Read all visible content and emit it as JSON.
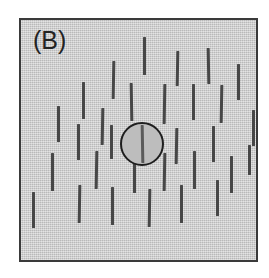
{
  "figure": {
    "panel_label": "(B)",
    "panel_width": 239,
    "panel_height": 244,
    "panel_left": 19,
    "panel_top": 18,
    "background_color": "#c9c9c9",
    "border_color": "#3a3a3a",
    "line_color": "#474747",
    "label_color": "#232323",
    "canvas_color": "#ffffff"
  },
  "target": {
    "name": "central-disc",
    "center_x": 121,
    "center_y": 124,
    "radius": 22,
    "fill_color": "#bdbdbd",
    "outline_color": "#1e1e1e",
    "inner_line_length": 38,
    "inner_line_tilt_deg": -1,
    "inner_line_color": "#5a5a5a"
  },
  "chart_data": {
    "type": "scatter",
    "title": "(B)",
    "xlabel": "",
    "ylabel": "",
    "xlim": [
      0,
      239
    ],
    "ylim": [
      0,
      244
    ],
    "grid": false,
    "legend": null,
    "element_count": 30,
    "elements": [
      {
        "x": 123,
        "y": 36,
        "length": 38,
        "angle": 0,
        "width": 3
      },
      {
        "x": 156,
        "y": 48,
        "length": 35,
        "angle": 1,
        "width": 3
      },
      {
        "x": 187,
        "y": 46,
        "length": 36,
        "angle": -1,
        "width": 3
      },
      {
        "x": 92,
        "y": 60,
        "length": 38,
        "angle": 1,
        "width": 3
      },
      {
        "x": 217,
        "y": 62,
        "length": 36,
        "angle": 0,
        "width": 3
      },
      {
        "x": 62,
        "y": 80,
        "length": 37,
        "angle": 0,
        "width": 3
      },
      {
        "x": 110,
        "y": 82,
        "length": 38,
        "angle": -1,
        "width": 3
      },
      {
        "x": 143,
        "y": 84,
        "length": 40,
        "angle": 1,
        "width": 3
      },
      {
        "x": 172,
        "y": 82,
        "length": 36,
        "angle": 0,
        "width": 3
      },
      {
        "x": 200,
        "y": 84,
        "length": 38,
        "angle": 1,
        "width": 3
      },
      {
        "x": 37,
        "y": 104,
        "length": 36,
        "angle": 0,
        "width": 3
      },
      {
        "x": 81,
        "y": 106,
        "length": 37,
        "angle": 1,
        "width": 3
      },
      {
        "x": 232,
        "y": 108,
        "length": 36,
        "angle": 0,
        "width": 3
      },
      {
        "x": 57,
        "y": 122,
        "length": 36,
        "angle": 0,
        "width": 3
      },
      {
        "x": 90,
        "y": 122,
        "length": 34,
        "angle": 0,
        "width": 3
      },
      {
        "x": 155,
        "y": 126,
        "length": 36,
        "angle": 1,
        "width": 3
      },
      {
        "x": 192,
        "y": 124,
        "length": 36,
        "angle": 0,
        "width": 3
      },
      {
        "x": 31,
        "y": 152,
        "length": 38,
        "angle": 0,
        "width": 3
      },
      {
        "x": 75,
        "y": 150,
        "length": 38,
        "angle": 1,
        "width": 3
      },
      {
        "x": 113,
        "y": 154,
        "length": 38,
        "angle": 0,
        "width": 3
      },
      {
        "x": 143,
        "y": 152,
        "length": 38,
        "angle": 1,
        "width": 3
      },
      {
        "x": 173,
        "y": 150,
        "length": 38,
        "angle": 0,
        "width": 3
      },
      {
        "x": 210,
        "y": 154,
        "length": 37,
        "angle": 0,
        "width": 3
      },
      {
        "x": 58,
        "y": 184,
        "length": 38,
        "angle": 1,
        "width": 3
      },
      {
        "x": 91,
        "y": 186,
        "length": 38,
        "angle": 0,
        "width": 3
      },
      {
        "x": 128,
        "y": 188,
        "length": 38,
        "angle": 1,
        "width": 3
      },
      {
        "x": 160,
        "y": 184,
        "length": 38,
        "angle": 0,
        "width": 3
      },
      {
        "x": 196,
        "y": 178,
        "length": 36,
        "angle": 0,
        "width": 3
      },
      {
        "x": 12,
        "y": 190,
        "length": 36,
        "angle": 0,
        "width": 3
      },
      {
        "x": 228,
        "y": 140,
        "length": 30,
        "angle": 0,
        "width": 3
      }
    ]
  }
}
